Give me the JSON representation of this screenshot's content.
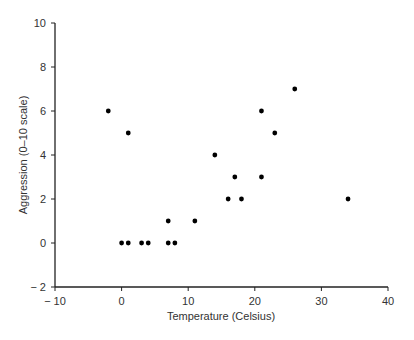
{
  "chart_data": {
    "type": "scatter",
    "title": "",
    "xlabel": "Temperature (Celsius)",
    "ylabel": "Aggression (0–10 scale)",
    "xlim": [
      -10,
      40
    ],
    "ylim": [
      -2,
      10
    ],
    "xticks": [
      -10,
      0,
      10,
      20,
      30,
      40
    ],
    "yticks": [
      -2,
      0,
      2,
      4,
      6,
      8,
      10
    ],
    "xtick_labels": [
      "− 10",
      "0",
      "10",
      "20",
      "30",
      "40"
    ],
    "ytick_labels": [
      "− 2",
      "0",
      "2",
      "4",
      "6",
      "8",
      "10"
    ],
    "grid": false,
    "legend": null,
    "marker_color": "#000000",
    "series": [
      {
        "name": "observations",
        "points": [
          {
            "x": -2,
            "y": 6
          },
          {
            "x": 1,
            "y": 5
          },
          {
            "x": 0,
            "y": 0
          },
          {
            "x": 1,
            "y": 0
          },
          {
            "x": 3,
            "y": 0
          },
          {
            "x": 4,
            "y": 0
          },
          {
            "x": 7,
            "y": 0
          },
          {
            "x": 8,
            "y": 0
          },
          {
            "x": 7,
            "y": 1
          },
          {
            "x": 11,
            "y": 1
          },
          {
            "x": 14,
            "y": 4
          },
          {
            "x": 16,
            "y": 2
          },
          {
            "x": 17,
            "y": 3
          },
          {
            "x": 18,
            "y": 2
          },
          {
            "x": 21,
            "y": 6
          },
          {
            "x": 21,
            "y": 3
          },
          {
            "x": 23,
            "y": 5
          },
          {
            "x": 26,
            "y": 7
          },
          {
            "x": 34,
            "y": 2
          }
        ]
      }
    ]
  }
}
